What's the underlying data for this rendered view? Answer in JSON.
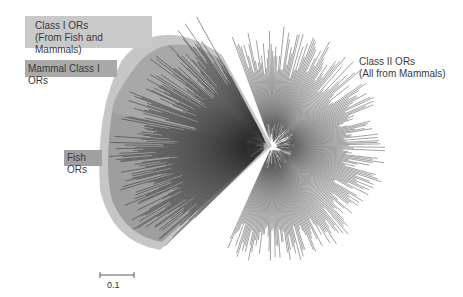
{
  "figure": {
    "type": "unrooted phylogenetic tree",
    "labels": {
      "class1": {
        "line1": "Class I ORs",
        "line2": "(From Fish and Mammals)"
      },
      "mammal_class1": "Mammal Class I ORs",
      "fish": "Fish ORs",
      "class2": {
        "line1": "Class II ORs",
        "line2": "(All from Mammals)"
      }
    },
    "scale_bar": {
      "value": "0.1"
    },
    "colors": {
      "class1_envelope": "#c4c4c4",
      "mammal_region": "#a6a6a6",
      "fish_region": "#9c9c9c",
      "branch_dark": "#2a2a2a",
      "branch_light": "#555555"
    }
  }
}
